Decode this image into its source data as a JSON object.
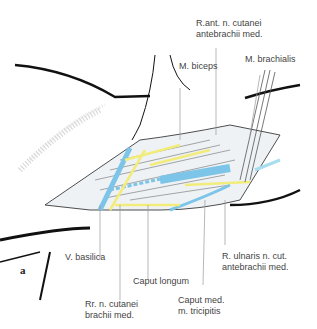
{
  "figure": {
    "panel_letter": "a",
    "colors": {
      "vein": "#7cc4e8",
      "nerve": "#f2ec7a",
      "outline": "#111111",
      "label_line": "#999999"
    }
  },
  "labels": {
    "r_ant_n_cutanei_1": "R.ant. n. cutanei",
    "r_ant_n_cutanei_2": "antebrachii med.",
    "m_brachialis": "M. brachialis",
    "m_biceps": "M. biceps",
    "v_basilica": "V. basilica",
    "caput_longum": "Caput longum",
    "rr_n_cutanei_1": "Rr. n. cutanei",
    "rr_n_cutanei_2": "brachii med.",
    "caput_med_1": "Caput med.",
    "caput_med_2": "m. tricipitis",
    "r_ulnaris_1": "R. ulnaris n. cut.",
    "r_ulnaris_2": "antebrachii med."
  }
}
